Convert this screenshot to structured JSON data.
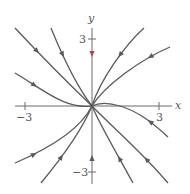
{
  "diagram": {
    "type": "phase-portrait",
    "equilibrium": "stable node at origin",
    "axes": {
      "x_label": "x",
      "y_label": "y",
      "x_ticks": [
        {
          "value": -3,
          "label": "−3"
        },
        {
          "value": 3,
          "label": "3"
        }
      ],
      "y_ticks": [
        {
          "value": 3,
          "label": "3"
        },
        {
          "value": -3,
          "label": "−3"
        }
      ]
    },
    "colors": {
      "curve": "#5a5a5a",
      "axis": "#6a6a6a",
      "highlight_arrow": "#b04a5a"
    },
    "trajectories": [
      {
        "name": "upper-left-steep",
        "d": "M15,28 C45,60 70,85 92,106",
        "arrow": [
          36,
          57
        ]
      },
      {
        "name": "upper-left-mid",
        "d": "M51,28 C62,55 78,88 92,106",
        "arrow": [
          64,
          57
        ]
      },
      {
        "name": "left-shallow",
        "d": "M15,73 C40,88 60,104 80,106 C86,107 90,106 92,106",
        "arrow": [
          36,
          89
        ]
      },
      {
        "name": "upper-right-steep",
        "d": "M144,28 C125,45 100,80 92,106",
        "arrow": [
          120,
          58
        ]
      },
      {
        "name": "upper-right-shallow",
        "d": "M170,47 C140,60 105,85 92,106",
        "arrow": [
          147,
          58
        ]
      },
      {
        "name": "right-low",
        "d": "M92,106 C100,102 110,103 120,106 C140,112 155,125 168,137",
        "arrow": [
          146,
          123
        ]
      },
      {
        "name": "lower-left-shallow",
        "d": "M15,163 C50,148 80,130 92,106",
        "arrow": [
          37,
          154
        ]
      },
      {
        "name": "lower-left-steep",
        "d": "M41,183 C60,160 82,130 92,106",
        "arrow": [
          63,
          155
        ]
      },
      {
        "name": "lower-right-steep",
        "d": "M133,183 C115,150 100,125 92,106",
        "arrow": [
          120,
          155
        ]
      },
      {
        "name": "lower-right-far",
        "d": "M168,183 C140,150 110,125 92,106",
        "arrow": [
          146,
          155
        ]
      }
    ],
    "axis_arrows": [
      {
        "name": "y-axis-upper-arrow",
        "x": 92,
        "y": 57,
        "dir": "down",
        "highlight": true
      },
      {
        "name": "y-axis-lower-arrow",
        "x": 92,
        "y": 155,
        "dir": "up",
        "highlight": false
      }
    ]
  }
}
